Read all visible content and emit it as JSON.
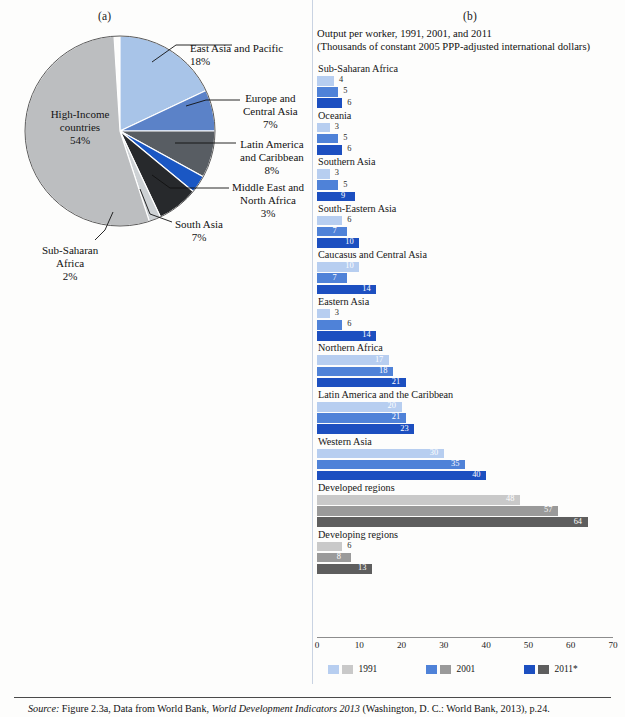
{
  "panel_a": {
    "letter": "(a)",
    "slices": [
      {
        "name": "East Asia and Pacific",
        "label_lines": [
          "East Asia and Pacific"
        ],
        "pct_text": "18%",
        "value": 18,
        "color": "#a8c4e8"
      },
      {
        "name": "Europe and Central Asia",
        "label_lines": [
          "Europe and",
          "Central Asia"
        ],
        "pct_text": "7%",
        "value": 7,
        "color": "#5b82c8"
      },
      {
        "name": "Latin America and Caribbean",
        "label_lines": [
          "Latin America",
          "and Caribbean"
        ],
        "pct_text": "8%",
        "value": 8,
        "color": "#585d63"
      },
      {
        "name": "Middle East and North Africa",
        "label_lines": [
          "Middle East and",
          "North Africa"
        ],
        "pct_text": "3%",
        "value": 3,
        "color": "#1a57c4"
      },
      {
        "name": "South Asia",
        "label_lines": [
          "South Asia"
        ],
        "pct_text": "7%",
        "value": 7,
        "color": "#27292c"
      },
      {
        "name": "Sub-Saharan Africa",
        "label_lines": [
          "Sub-Saharan",
          "Africa"
        ],
        "pct_text": "2%",
        "value": 2,
        "color": "#cdd1d4"
      },
      {
        "name": "High-Income countries",
        "label_lines": [
          "High-Income",
          "countries"
        ],
        "pct_text": "54%",
        "value": 54,
        "color": "#bcbec0"
      }
    ]
  },
  "panel_b": {
    "letter": "(b)",
    "title_line1": "Output per worker, 1991, 2001, and 2011",
    "title_line2": "(Thousands of constant 2005 PPP-adjusted international dollars)",
    "footnote": "* Figures for 2011 are preliminary estimates.",
    "legend": [
      {
        "label": "1991",
        "blue": "#b7cef0",
        "gray": "#c9c9c9"
      },
      {
        "label": "2001",
        "blue": "#4f82d8",
        "gray": "#9a9a9a"
      },
      {
        "label": "2011*",
        "blue": "#1c4fc0",
        "gray": "#5e5e5e"
      }
    ]
  },
  "chart_data": {
    "type": "bar",
    "orientation": "horizontal",
    "title": "Output per worker, 1991, 2001, and 2011",
    "subtitle": "(Thousands of constant 2005 PPP-adjusted international dollars)",
    "xlabel": "",
    "ylabel": "",
    "xlim": [
      0,
      70
    ],
    "xticks": [
      "0",
      "10",
      "20",
      "30",
      "40",
      "50",
      "60",
      "70"
    ],
    "grid": false,
    "legend_position": "bottom",
    "series_names": [
      "1991",
      "2001",
      "2011*"
    ],
    "categories": [
      "Sub-Saharan Africa",
      "Oceania",
      "Southern Asia",
      "South-Eastern Asia",
      "Caucasus and Central Asia",
      "Eastern Asia",
      "Northern Africa",
      "Latin America and the Caribbean",
      "Western Asia",
      "Developed regions",
      "Developing regions"
    ],
    "series": [
      {
        "name": "1991",
        "values": [
          4,
          3,
          3,
          6,
          10,
          3,
          17,
          20,
          30,
          48,
          6
        ]
      },
      {
        "name": "2001",
        "values": [
          5,
          5,
          5,
          7,
          7,
          6,
          18,
          21,
          35,
          57,
          8
        ]
      },
      {
        "name": "2011*",
        "values": [
          6,
          6,
          9,
          10,
          14,
          14,
          21,
          23,
          40,
          64,
          13
        ]
      }
    ],
    "group_palettes": {
      "blue": [
        "#b7cef0",
        "#4f82d8",
        "#1c4fc0"
      ],
      "gray": [
        "#c9c9c9",
        "#9a9a9a",
        "#5e5e5e"
      ]
    },
    "gray_categories": [
      "Developed regions",
      "Developing regions"
    ]
  },
  "pie_chart_data": {
    "type": "pie",
    "title": "",
    "labels": [
      "East Asia and Pacific",
      "Europe and Central Asia",
      "Latin America and Caribbean",
      "Middle East and North Africa",
      "South Asia",
      "Sub-Saharan Africa",
      "High-Income countries"
    ],
    "values": [
      18,
      7,
      8,
      3,
      7,
      2,
      54
    ],
    "value_labels": [
      "18%",
      "7%",
      "8%",
      "3%",
      "7%",
      "2%",
      "54%"
    ]
  },
  "source": {
    "prefix": "Source:",
    "pre_italic": " Figure 2.3a, Data from World Bank, ",
    "italic": "World Development Indicators 2013",
    "post_italic": " (Washington, D. C.: World Bank, 2013), p.24."
  }
}
